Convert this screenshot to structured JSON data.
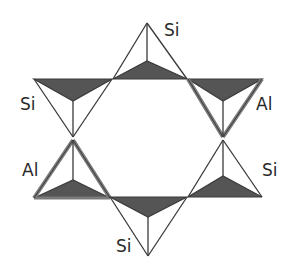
{
  "diagram": {
    "colors": {
      "shade": "#555555",
      "line": "#3a3a3a",
      "al_outline": "#7a7a7a",
      "text": "#2a2a2a"
    },
    "tetrahedra": [
      {
        "id": "top",
        "label": "Si",
        "orientation": "up"
      },
      {
        "id": "upper-left",
        "label": "Si",
        "orientation": "down"
      },
      {
        "id": "upper-right",
        "label": "Al",
        "orientation": "down"
      },
      {
        "id": "lower-left",
        "label": "Al",
        "orientation": "up"
      },
      {
        "id": "lower-right",
        "label": "Si",
        "orientation": "up"
      },
      {
        "id": "bottom",
        "label": "Si",
        "orientation": "down"
      }
    ],
    "labels": {
      "top": "Si",
      "upper_left": "Si",
      "upper_right": "Al",
      "lower_left": "Al",
      "lower_right": "Si",
      "bottom": "Si"
    }
  }
}
